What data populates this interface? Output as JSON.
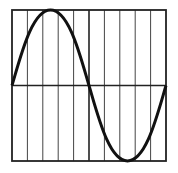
{
  "diagram": {
    "type": "sine-wave-grid",
    "grid": {
      "vertical_divisions": 10,
      "horizontal_axis": "center"
    },
    "wave": {
      "cycles": 1,
      "start_phase": "zero-crossing rising"
    },
    "colors": {
      "stroke": "#111111",
      "grid": "#333333",
      "background": "#ffffff"
    }
  }
}
